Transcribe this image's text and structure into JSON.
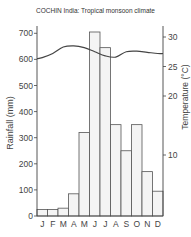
{
  "chart_data": {
    "type": "bar",
    "title": "COCHIN India: Tropical monsoon climate",
    "xlabel": "",
    "ylabel": "Rainfall (mm)",
    "y2label": "Temperature (°C)",
    "categories": [
      "J",
      "F",
      "M",
      "A",
      "M",
      "J",
      "J",
      "A",
      "S",
      "O",
      "N",
      "D"
    ],
    "series": [
      {
        "name": "Rainfall (mm)",
        "type": "bar",
        "axis": "left",
        "values": [
          25,
          25,
          30,
          85,
          320,
          705,
          645,
          350,
          250,
          350,
          170,
          95
        ]
      },
      {
        "name": "Temperature (°C)",
        "type": "line",
        "axis": "right",
        "values": [
          26.5,
          27.2,
          28.3,
          28.5,
          28.2,
          27.5,
          26.8,
          26.6,
          27.5,
          27.6,
          27.4,
          27.2
        ]
      }
    ],
    "ylim": [
      0,
      750
    ],
    "y2lim": [
      0,
      32
    ],
    "yticks": [
      0,
      100,
      200,
      300,
      400,
      500,
      600,
      700
    ],
    "y2ticks": [
      10,
      20,
      25,
      30
    ],
    "grid": false,
    "legend": "none"
  },
  "labels": {
    "title": "COCHIN India: Tropical monsoon climate",
    "y_left": "Rainfall (mm)",
    "y_right": "Temperature (°C)"
  },
  "colors": {
    "bar_fill": "#f4f4f4",
    "bar_stroke": "#555555",
    "line": "#444444",
    "axis": "#444444"
  }
}
